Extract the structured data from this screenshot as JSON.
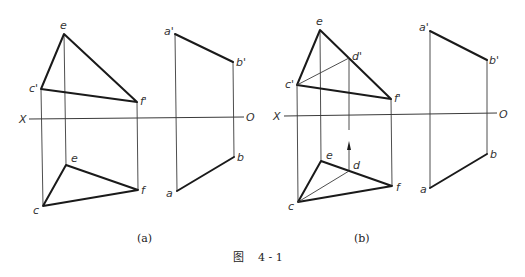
{
  "figure": {
    "caption_label": "图",
    "caption_number": "4 - 1",
    "subfigures": [
      {
        "id": "a",
        "caption": "(a)",
        "axis": {
          "left_label": "X",
          "right_label": "O"
        },
        "labels": {
          "e_prime": "e",
          "c_prime": "c'",
          "f_prime": "f'",
          "a_prime": "a'",
          "b_prime": "b'",
          "e": "e",
          "c": "c",
          "f": "f",
          "a": "a",
          "b": "b"
        }
      },
      {
        "id": "b",
        "caption": "(b)",
        "axis": {
          "left_label": "X",
          "right_label": "O"
        },
        "labels": {
          "e_prime": "e",
          "c_prime": "c'",
          "f_prime": "f'",
          "d_prime": "d'",
          "a_prime": "a'",
          "b_prime": "b'",
          "e": "e",
          "c": "c",
          "f": "f",
          "d": "d",
          "a": "a",
          "b": "b"
        }
      }
    ]
  },
  "colors": {
    "line": "#1a1a1a",
    "thin_line": "#3a3a3a",
    "background": "#ffffff"
  }
}
